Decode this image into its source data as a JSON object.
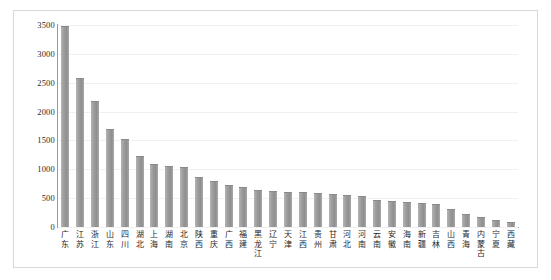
{
  "chart_data": {
    "type": "bar",
    "title": "",
    "subtitle": "",
    "xlabel": "",
    "ylabel": "",
    "ylim": [
      0,
      3500
    ],
    "grid": false,
    "legend": "none",
    "y_ticks": [
      "0",
      "500",
      "1000",
      "1500",
      "2000",
      "2500",
      "3000",
      "3500"
    ],
    "y_tick_values": [
      0,
      500,
      1000,
      1500,
      2000,
      2500,
      3000,
      3500
    ],
    "categories": [
      "广东",
      "江苏",
      "浙江",
      "山东",
      "四川",
      "湖北",
      "上海",
      "湖南",
      "北京",
      "陕西",
      "重庆",
      "广西",
      "福建",
      "黑龙江",
      "辽宁",
      "天津",
      "江西",
      "贵州",
      "甘肃",
      "河北",
      "河南",
      "云南",
      "安徽",
      "海南",
      "新疆",
      "吉林",
      "山西",
      "青海",
      "内蒙古",
      "宁夏",
      "西藏"
    ],
    "values": [
      3490,
      2580,
      2180,
      1700,
      1525,
      1230,
      1090,
      1065,
      1040,
      860,
      800,
      720,
      700,
      640,
      620,
      615,
      600,
      595,
      580,
      560,
      545,
      470,
      450,
      430,
      420,
      400,
      310,
      230,
      170,
      120,
      80
    ],
    "bar_color": "#9d9d9d",
    "axis_color": "#9a9a9a",
    "frame_color": "#d9d9d9",
    "background_color": "#ffffff"
  }
}
